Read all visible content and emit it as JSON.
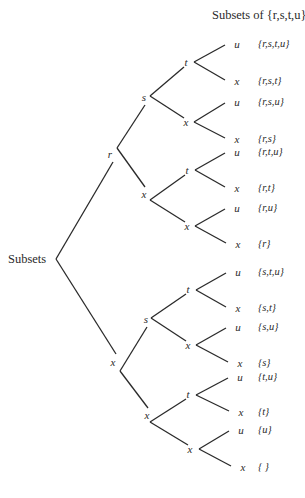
{
  "title": "Subsets of {r,s,t,u}",
  "root_label": "Subsets",
  "colors": {
    "ink": "#2a2a2a",
    "background": "#ffffff"
  },
  "nodes": {
    "root": {
      "x": 56,
      "y": 259
    },
    "l1": [
      {
        "label": "r",
        "x": 117,
        "y": 148,
        "lx": 110,
        "ly": 154
      },
      {
        "label": "x",
        "x": 120,
        "y": 371,
        "lx": 113,
        "ly": 362
      }
    ],
    "l2": [
      {
        "label": "s",
        "x": 150,
        "y": 96,
        "lx": 144,
        "ly": 97
      },
      {
        "label": "x",
        "x": 150,
        "y": 200,
        "lx": 144,
        "ly": 194
      },
      {
        "label": "s",
        "x": 151,
        "y": 318,
        "lx": 146,
        "ly": 319
      },
      {
        "label": "x",
        "x": 150,
        "y": 422,
        "lx": 147,
        "ly": 415
      }
    ],
    "l3": [
      {
        "label": "t",
        "x": 194,
        "y": 62,
        "lx": 186,
        "ly": 62
      },
      {
        "label": "x",
        "x": 194,
        "y": 122,
        "lx": 186,
        "ly": 122
      },
      {
        "label": "t",
        "x": 195,
        "y": 170,
        "lx": 187,
        "ly": 170
      },
      {
        "label": "x",
        "x": 195,
        "y": 226,
        "lx": 187,
        "ly": 226
      },
      {
        "label": "t",
        "x": 196,
        "y": 290,
        "lx": 188,
        "ly": 289
      },
      {
        "label": "x",
        "x": 196,
        "y": 345,
        "lx": 188,
        "ly": 345
      },
      {
        "label": "t",
        "x": 196,
        "y": 395,
        "lx": 188,
        "ly": 394
      },
      {
        "label": "x",
        "x": 199,
        "y": 449,
        "lx": 190,
        "ly": 449
      }
    ],
    "leaves": [
      {
        "label": "u",
        "x": 225,
        "y": 44,
        "subset": "{r,s,t,u}"
      },
      {
        "label": "x",
        "x": 225,
        "y": 81,
        "subset": "{r,s,t}"
      },
      {
        "label": "u",
        "x": 225,
        "y": 102,
        "subset": "{r,s,u}"
      },
      {
        "label": "x",
        "x": 225,
        "y": 139,
        "subset": "{r,s}"
      },
      {
        "label": "u",
        "x": 225,
        "y": 152,
        "subset": "{r,t,u}"
      },
      {
        "label": "x",
        "x": 225,
        "y": 188,
        "subset": "{r,t}"
      },
      {
        "label": "u",
        "x": 225,
        "y": 208,
        "subset": "{r,u}"
      },
      {
        "label": "x",
        "x": 226,
        "y": 244,
        "subset": "{r}"
      },
      {
        "label": "u",
        "x": 226,
        "y": 272,
        "subset": "{s,t,u}"
      },
      {
        "label": "x",
        "x": 226,
        "y": 308,
        "subset": "{s,t}"
      },
      {
        "label": "u",
        "x": 226,
        "y": 327,
        "subset": "{s,u}"
      },
      {
        "label": "x",
        "x": 228,
        "y": 363,
        "subset": "{s}"
      },
      {
        "label": "u",
        "x": 228,
        "y": 377,
        "subset": "{t,u}"
      },
      {
        "label": "x",
        "x": 229,
        "y": 412,
        "subset": "{t}"
      },
      {
        "label": "u",
        "x": 229,
        "y": 430,
        "subset": "{u}"
      },
      {
        "label": "x",
        "x": 231,
        "y": 467,
        "subset": "{      }"
      }
    ]
  }
}
